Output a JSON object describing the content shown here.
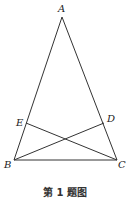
{
  "figure": {
    "caption": "第 1 题图",
    "points": [
      {
        "id": "A",
        "label": "A"
      },
      {
        "id": "B",
        "label": "B"
      },
      {
        "id": "C",
        "label": "C"
      },
      {
        "id": "D",
        "label": "D"
      },
      {
        "id": "E",
        "label": "E"
      }
    ],
    "segments": [
      {
        "from": "A",
        "to": "B"
      },
      {
        "from": "A",
        "to": "C"
      },
      {
        "from": "B",
        "to": "C"
      },
      {
        "from": "B",
        "to": "D"
      },
      {
        "from": "C",
        "to": "E"
      }
    ],
    "line_color": "#333333"
  }
}
